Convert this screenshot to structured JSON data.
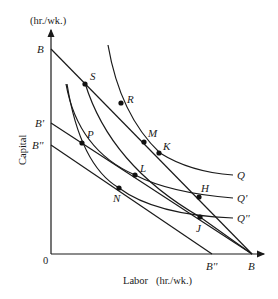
{
  "diagram": {
    "y_axis": {
      "unit": "(hr./wk.)",
      "label": "Capital"
    },
    "x_axis": {
      "unit": "Labor   (hr./wk.)",
      "origin": "0"
    },
    "budget_lines": [
      {
        "name": "B",
        "start_label": "B",
        "end_label": "B"
      },
      {
        "name": "B-prime",
        "start_label": "B'",
        "end_label": "B"
      },
      {
        "name": "B-double-prime",
        "start_label": "B''",
        "end_label": "B''"
      }
    ],
    "isoquants": [
      {
        "name": "Q",
        "label": "Q"
      },
      {
        "name": "Q-prime",
        "label": "Q'"
      },
      {
        "name": "Q-double-prime",
        "label": "Q''"
      }
    ],
    "points": [
      {
        "id": "S",
        "label": "S"
      },
      {
        "id": "R",
        "label": "R"
      },
      {
        "id": "M",
        "label": "M"
      },
      {
        "id": "K",
        "label": "K"
      },
      {
        "id": "P",
        "label": "P"
      },
      {
        "id": "L",
        "label": "L"
      },
      {
        "id": "N",
        "label": "N"
      },
      {
        "id": "H",
        "label": "H"
      },
      {
        "id": "J",
        "label": "J"
      }
    ]
  }
}
